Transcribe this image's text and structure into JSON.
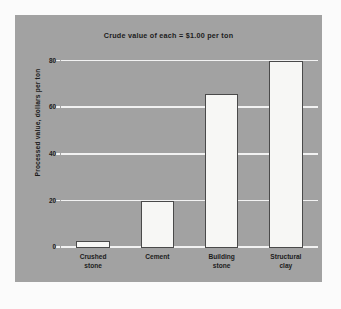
{
  "chart_data": {
    "type": "bar",
    "title": "Crude value of each = $1.00 per ton",
    "xlabel": "",
    "ylabel": "Processed value, dollars per ton",
    "categories": [
      "Crushed stone",
      "Cement",
      "Building stone",
      "Structural clay"
    ],
    "category_lines": [
      [
        "Crushed",
        "stone"
      ],
      [
        "Cement",
        ""
      ],
      [
        "Building",
        "stone"
      ],
      [
        "Structural",
        "clay"
      ]
    ],
    "values": [
      3,
      20,
      66,
      80
    ],
    "ylim": [
      0,
      84
    ],
    "yticks": [
      0,
      20,
      40,
      60,
      80
    ],
    "ytick_labels": [
      "0",
      "20",
      "40",
      "60",
      "80"
    ],
    "grid": true,
    "legend": false,
    "colors": {
      "panel_background": "#a2a2a2",
      "page_background": "#fbfbfb",
      "gridline": "#f2f2f2",
      "bar_fill": "#f7f7f5",
      "bar_outline": "#4a4a4a",
      "text": "#1c1c1c"
    }
  }
}
